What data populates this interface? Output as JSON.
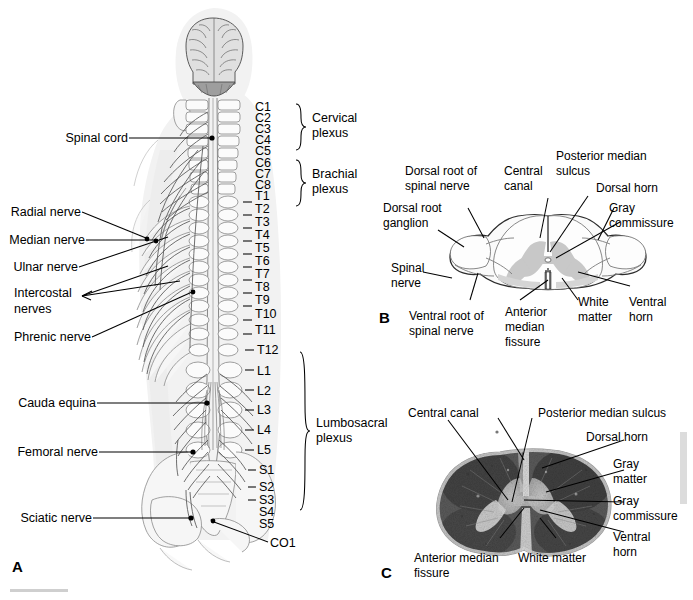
{
  "figure": {
    "panels": [
      {
        "id": "A",
        "label": "A"
      },
      {
        "id": "B",
        "label": "B"
      },
      {
        "id": "C",
        "label": "C"
      }
    ]
  },
  "panel_a": {
    "label": "A",
    "left_labels": [
      {
        "name": "spinal-cord",
        "text": "Spinal cord"
      },
      {
        "name": "radial-nerve",
        "text": "Radial nerve"
      },
      {
        "name": "median-nerve",
        "text": "Median nerve"
      },
      {
        "name": "ulnar-nerve",
        "text": "Ulnar nerve"
      },
      {
        "name": "intercostal-nerves",
        "text": "Intercostal"
      },
      {
        "name": "intercostal-nerves-line2",
        "text": "nerves"
      },
      {
        "name": "phrenic-nerve",
        "text": "Phrenic nerve"
      },
      {
        "name": "cauda-equina",
        "text": "Cauda equina"
      },
      {
        "name": "femoral-nerve",
        "text": "Femoral nerve"
      },
      {
        "name": "sciatic-nerve",
        "text": "Sciatic nerve"
      }
    ],
    "vertebrae": [
      "C1",
      "C2",
      "C3",
      "C4",
      "C5",
      "C6",
      "C7",
      "C8",
      "T1",
      "T2",
      "T3",
      "T4",
      "T5",
      "T6",
      "T7",
      "T8",
      "T9",
      "T10",
      "T11",
      "T12",
      "L1",
      "L2",
      "L3",
      "L4",
      "L5",
      "S1",
      "S2",
      "S3",
      "S4",
      "S5",
      "CO1"
    ],
    "plexuses": [
      {
        "name": "cervical-plexus",
        "line1": "Cervical",
        "line2": "plexus",
        "range": "C1-C5"
      },
      {
        "name": "brachial-plexus",
        "line1": "Brachial",
        "line2": "plexus",
        "range": "C6-T1"
      },
      {
        "name": "lumbosacral-plexus",
        "line1": "Lumbosacral",
        "line2": "plexus",
        "range": "T12-S5"
      }
    ]
  },
  "panel_b": {
    "label": "B",
    "caption": "Cross section of spinal cord (diagram)",
    "labels": [
      {
        "name": "dorsal-root-of-spinal-nerve",
        "line1": "Dorsal root of",
        "line2": "spinal nerve"
      },
      {
        "name": "dorsal-root-ganglion",
        "line1": "Dorsal root",
        "line2": "ganglion"
      },
      {
        "name": "spinal-nerve",
        "line1": "Spinal",
        "line2": "nerve"
      },
      {
        "name": "ventral-root-of-spinal-nerve",
        "line1": "Ventral root of",
        "line2": "spinal nerve"
      },
      {
        "name": "central-canal",
        "line1": "Central",
        "line2": "canal"
      },
      {
        "name": "posterior-median-sulcus",
        "line1": "Posterior median",
        "line2": "sulcus"
      },
      {
        "name": "dorsal-horn",
        "line1": "Dorsal horn",
        "line2": ""
      },
      {
        "name": "gray-commissure",
        "line1": "Gray",
        "line2": "commissure"
      },
      {
        "name": "ventral-horn",
        "line1": "Ventral",
        "line2": "horn"
      },
      {
        "name": "white-matter",
        "line1": "White",
        "line2": "matter"
      },
      {
        "name": "anterior-median-fissure",
        "line1": "Anterior",
        "line2": "median",
        "line3": "fissure"
      }
    ]
  },
  "panel_c": {
    "label": "C",
    "caption": "Cross section of spinal cord (histology)",
    "labels": [
      {
        "name": "central-canal",
        "line1": "Central canal",
        "line2": ""
      },
      {
        "name": "posterior-median-sulcus",
        "line1": "Posterior median sulcus",
        "line2": ""
      },
      {
        "name": "dorsal-horn",
        "line1": "Dorsal horn",
        "line2": ""
      },
      {
        "name": "gray-matter",
        "line1": "Gray",
        "line2": "matter"
      },
      {
        "name": "gray-commissure",
        "line1": "Gray",
        "line2": "commissure"
      },
      {
        "name": "ventral-horn",
        "line1": "Ventral",
        "line2": "horn"
      },
      {
        "name": "white-matter",
        "line1": "White matter",
        "line2": ""
      },
      {
        "name": "anterior-median-fissure",
        "line1": "Anterior median",
        "line2": "fissure"
      }
    ]
  },
  "colors": {
    "ink": "#000000",
    "body_fill": "#f2f2f2",
    "bone_stroke": "#8e8e8e",
    "gray_matter": "#c8c8c8",
    "white_matter": "#fdfdfd",
    "nerve": "#555555"
  }
}
